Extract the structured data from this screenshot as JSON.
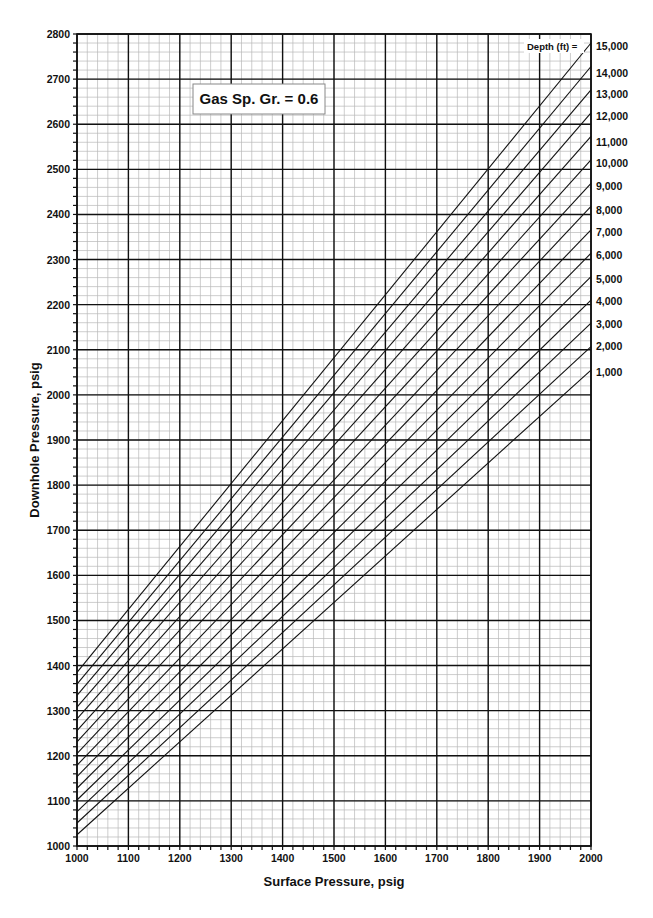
{
  "chart_data": {
    "type": "line",
    "title": "",
    "annotation": "Gas Sp. Gr. = 0.6",
    "xlabel": "Surface Pressure, psig",
    "ylabel": "Downhole Pressure, psig",
    "xlim": [
      1000,
      2000
    ],
    "ylim": [
      1000,
      2800
    ],
    "x_ticks": [
      1000,
      1100,
      1200,
      1300,
      1400,
      1500,
      1600,
      1700,
      1800,
      1900,
      2000
    ],
    "y_ticks": [
      1000,
      1100,
      1200,
      1300,
      1400,
      1500,
      1600,
      1700,
      1800,
      1900,
      2000,
      2100,
      2200,
      2300,
      2400,
      2500,
      2600,
      2700,
      2800
    ],
    "x_minor_step": 20,
    "y_minor_step": 20,
    "grid": true,
    "legend_header": "Depth (ft) =",
    "legend_position": "right",
    "x": [
      1000,
      2000
    ],
    "series": [
      {
        "name": "1,000",
        "values": [
          1025,
          2055
        ]
      },
      {
        "name": "2,000",
        "values": [
          1051,
          2107
        ]
      },
      {
        "name": "3,000",
        "values": [
          1076,
          2159
        ]
      },
      {
        "name": "4,000",
        "values": [
          1102,
          2210
        ]
      },
      {
        "name": "5,000",
        "values": [
          1128,
          2262
        ]
      },
      {
        "name": "6,000",
        "values": [
          1154,
          2314
        ]
      },
      {
        "name": "7,000",
        "values": [
          1179,
          2366
        ]
      },
      {
        "name": "8,000",
        "values": [
          1205,
          2418
        ]
      },
      {
        "name": "9,000",
        "values": [
          1231,
          2469
        ]
      },
      {
        "name": "10,000",
        "values": [
          1256,
          2521
        ]
      },
      {
        "name": "11,000",
        "values": [
          1282,
          2573
        ]
      },
      {
        "name": "12,000",
        "values": [
          1308,
          2625
        ]
      },
      {
        "name": "13,000",
        "values": [
          1334,
          2676
        ]
      },
      {
        "name": "14,000",
        "values": [
          1359,
          2728
        ]
      },
      {
        "name": "15,000",
        "values": [
          1385,
          2780
        ]
      }
    ],
    "depth_label_y_px": [
      372,
      346,
      324,
      301,
      279,
      255,
      232,
      210,
      186,
      163,
      142,
      116,
      94,
      73,
      46
    ]
  },
  "colors": {
    "major_grid": "#111111",
    "minor_grid": "#b8b8b8",
    "line": "#111111",
    "background": "#ffffff"
  }
}
